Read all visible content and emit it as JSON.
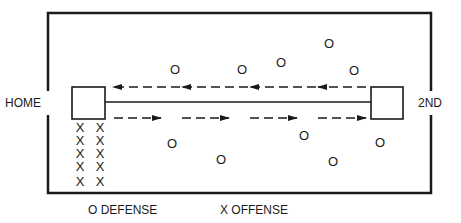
{
  "diagram": {
    "labels": {
      "home": "HOME",
      "second": "2ND"
    },
    "legend": {
      "defense": "O DEFENSE",
      "offense": "X OFFENSE"
    },
    "markers": {
      "defense_symbol": "O",
      "offense_symbol": "X"
    },
    "arrows": {
      "top_direction": "left",
      "bottom_direction": "right"
    },
    "colors": {
      "ink": "#1a1a1a",
      "background": "#ffffff"
    }
  }
}
